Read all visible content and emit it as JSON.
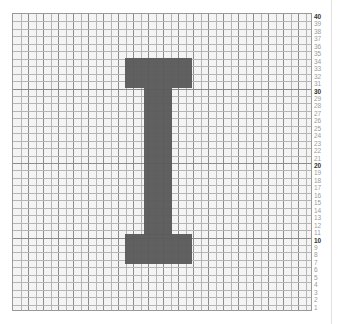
{
  "diagram": {
    "type": "pixel-grid-chart",
    "letter": "I",
    "grid": {
      "rows": 40,
      "cols": 40,
      "major_every": 10
    },
    "row_labels": [
      "40",
      "39",
      "38",
      "37",
      "36",
      "35",
      "34",
      "33",
      "32",
      "31",
      "30",
      "29",
      "28",
      "27",
      "26",
      "25",
      "24",
      "23",
      "22",
      "21",
      "20",
      "19",
      "18",
      "17",
      "16",
      "15",
      "14",
      "13",
      "12",
      "11",
      "10",
      "9",
      "8",
      "7",
      "6",
      "5",
      "4",
      "3",
      "2",
      "1"
    ],
    "major_labels": [
      "40",
      "30",
      "20",
      "10"
    ],
    "colors": {
      "fill": "#5b5b5b",
      "background": "#f4f4f4",
      "grid_minor": "#b5b5b5",
      "grid_major": "#8c8c8c"
    },
    "shapes": [
      {
        "name": "top-bar",
        "rows_label_range": [
          "35",
          "32"
        ],
        "x": 124,
        "y": 57,
        "w": 67,
        "h": 30
      },
      {
        "name": "stem",
        "rows_label_range": [
          "31",
          "12"
        ],
        "x": 143,
        "y": 87,
        "w": 28,
        "h": 147
      },
      {
        "name": "bottom-bar",
        "rows_label_range": [
          "11",
          "8"
        ],
        "x": 124,
        "y": 233,
        "w": 67,
        "h": 30
      }
    ]
  }
}
